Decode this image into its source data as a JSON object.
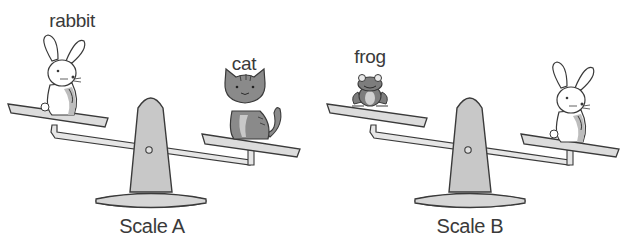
{
  "figure": {
    "scales": [
      {
        "caption": "Scale A",
        "left_item": "rabbit",
        "right_item": "cat",
        "tilt": "right side lower (cat heavier than rabbit)"
      },
      {
        "caption": "Scale B",
        "left_item": "frog",
        "right_item": "rabbit",
        "tilt": "right side lower (rabbit heavier than frog)"
      }
    ],
    "colors": {
      "outline": "#3a3a3a",
      "post_fill": "#c8c8c8",
      "pan_fill": "#dcdcdc",
      "beam_fill": "#e6e6e6",
      "cat_fill": "#8a8a8a",
      "frog_fill": "#7d7d7d",
      "rabbit_fill": "#ffffff"
    }
  }
}
